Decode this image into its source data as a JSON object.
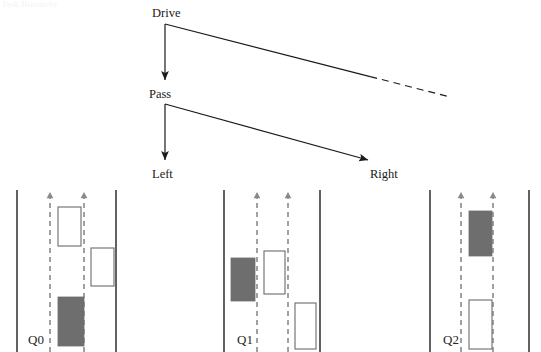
{
  "figure": {
    "ghost_header": "Task Hierarchy",
    "decision_tree": {
      "nodes": [
        {
          "id": "drive",
          "label": "Drive",
          "x": 152,
          "y": 7
        },
        {
          "id": "pass",
          "label": "Pass",
          "x": 149,
          "y": 88
        },
        {
          "id": "left",
          "label": "Left",
          "x": 152,
          "y": 168
        },
        {
          "id": "right",
          "label": "Right",
          "x": 370,
          "y": 168
        }
      ],
      "edges": [
        {
          "from": "drive",
          "to": "pass",
          "style": "solid",
          "arrow": true,
          "x1": 165,
          "y1": 24,
          "x2": 165,
          "y2": 80
        },
        {
          "from": "drive",
          "to": null,
          "style": "solid-to-dashed",
          "arrow": false,
          "x1": 165,
          "y1": 24,
          "x2": 450,
          "y2": 97,
          "dash_from": 0.72
        },
        {
          "from": "pass",
          "to": "left",
          "style": "solid",
          "arrow": true,
          "x1": 165,
          "y1": 104,
          "x2": 165,
          "y2": 160
        },
        {
          "from": "pass",
          "to": "right",
          "style": "solid",
          "arrow": true,
          "x1": 165,
          "y1": 104,
          "x2": 368,
          "y2": 160
        }
      ]
    },
    "scenarios": [
      {
        "id": "Q0",
        "label": "Q0",
        "label_x": 28,
        "label_y": 333,
        "road": {
          "left_edge_x": 17,
          "right_edge_x": 116,
          "lane_line_x": [
            50,
            84
          ],
          "top_y": 190,
          "bottom_y": 352
        },
        "lane_arrows": [
          {
            "x": 50,
            "y": 192
          },
          {
            "x": 84,
            "y": 192
          }
        ],
        "vehicles": [
          {
            "type": "other",
            "fill": "#ffffff",
            "x": 58,
            "y": 207,
            "w": 23,
            "h": 39
          },
          {
            "type": "other",
            "fill": "#ffffff",
            "x": 91,
            "y": 248,
            "w": 23,
            "h": 38
          },
          {
            "type": "ego",
            "fill": "#6e6e6e",
            "x": 58,
            "y": 297,
            "w": 26,
            "h": 49
          }
        ]
      },
      {
        "id": "Q1",
        "label": "Q1",
        "label_x": 237,
        "label_y": 333,
        "road": {
          "left_edge_x": 224,
          "right_edge_x": 320,
          "lane_line_x": [
            257,
            288
          ],
          "top_y": 190,
          "bottom_y": 352
        },
        "lane_arrows": [
          {
            "x": 257,
            "y": 192
          },
          {
            "x": 288,
            "y": 192
          }
        ],
        "vehicles": [
          {
            "type": "ego",
            "fill": "#6e6e6e",
            "x": 231,
            "y": 258,
            "w": 24,
            "h": 43
          },
          {
            "type": "other",
            "fill": "#ffffff",
            "x": 264,
            "y": 251,
            "w": 21,
            "h": 43
          },
          {
            "type": "other",
            "fill": "#ffffff",
            "x": 295,
            "y": 303,
            "w": 21,
            "h": 46
          }
        ]
      },
      {
        "id": "Q2",
        "label": "Q2",
        "label_x": 443,
        "label_y": 333,
        "road": {
          "left_edge_x": 430,
          "right_edge_x": 529,
          "lane_line_x": [
            461,
            493
          ],
          "top_y": 190,
          "bottom_y": 352
        },
        "lane_arrows": [
          {
            "x": 461,
            "y": 192
          },
          {
            "x": 493,
            "y": 192
          }
        ],
        "vehicles": [
          {
            "type": "ego",
            "fill": "#6e6e6e",
            "x": 469,
            "y": 211,
            "w": 23,
            "h": 45
          },
          {
            "type": "other",
            "fill": "#ffffff",
            "x": 469,
            "y": 300,
            "w": 23,
            "h": 49
          }
        ]
      }
    ],
    "colors": {
      "line": "#1a1a1a",
      "road_edge": "#3a3a3a",
      "lane_dash": "#8a8a8a",
      "ego_fill": "#6e6e6e",
      "other_fill": "#ffffff",
      "other_stroke": "#777777",
      "text": "#1a1a1a"
    }
  }
}
